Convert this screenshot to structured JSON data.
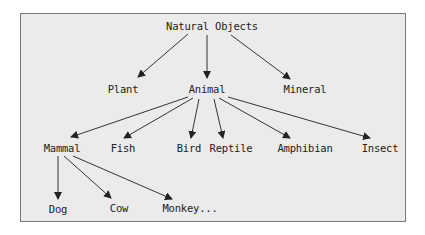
{
  "diagram": {
    "type": "tree",
    "nodes": {
      "root": {
        "label": "Natural Objects"
      },
      "plant": {
        "label": "Plant"
      },
      "animal": {
        "label": "Animal"
      },
      "mineral": {
        "label": "Mineral"
      },
      "mammal": {
        "label": "Mammal"
      },
      "fish": {
        "label": "Fish"
      },
      "bird": {
        "label": "Bird"
      },
      "reptile": {
        "label": "Reptile"
      },
      "amphibian": {
        "label": "Amphibian"
      },
      "insect": {
        "label": "Insect"
      },
      "dog": {
        "label": "Dog"
      },
      "cow": {
        "label": "Cow"
      },
      "monkey": {
        "label": "Monkey..."
      }
    },
    "edges": [
      [
        "Natural Objects",
        "Plant"
      ],
      [
        "Natural Objects",
        "Animal"
      ],
      [
        "Natural Objects",
        "Mineral"
      ],
      [
        "Animal",
        "Mammal"
      ],
      [
        "Animal",
        "Fish"
      ],
      [
        "Animal",
        "Bird"
      ],
      [
        "Animal",
        "Reptile"
      ],
      [
        "Animal",
        "Amphibian"
      ],
      [
        "Animal",
        "Insect"
      ],
      [
        "Mammal",
        "Dog"
      ],
      [
        "Mammal",
        "Cow"
      ],
      [
        "Mammal",
        "Monkey..."
      ]
    ],
    "colors": {
      "background": "#ebebeb",
      "border": "#7a7a7a",
      "ink": "#222222"
    }
  }
}
